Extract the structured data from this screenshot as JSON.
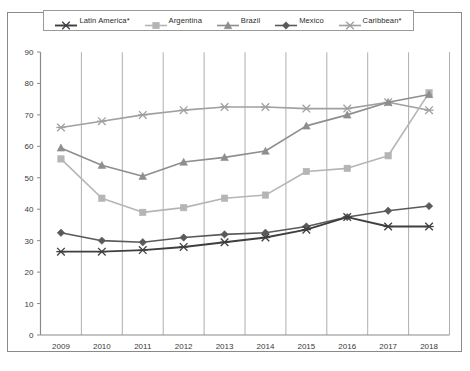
{
  "chart_data": {
    "type": "line",
    "title": "",
    "subtitle": "",
    "xlabel": "",
    "ylabel": "",
    "categories": [
      "2009",
      "2010",
      "2011",
      "2012",
      "2013",
      "2014",
      "2015",
      "2016",
      "2017",
      "2018"
    ],
    "xlim": [
      2009,
      2018
    ],
    "ylim": [
      0,
      90
    ],
    "ytick_values": [
      0,
      10,
      20,
      30,
      40,
      50,
      60,
      70,
      80,
      90
    ],
    "ytick_labels": [
      "0",
      "10",
      "20",
      "30",
      "40",
      "50",
      "60",
      "70",
      "80",
      "90"
    ],
    "xtick_labels": [
      "2009",
      "2010",
      "2011",
      "2012",
      "2013",
      "2014",
      "2015",
      "2016",
      "2017",
      "2018"
    ],
    "grid": "vertical",
    "legend_position": "top",
    "series": [
      {
        "name": "Latin America*",
        "marker": "cross",
        "color": "#3f3f3f",
        "values": [
          26.5,
          26.5,
          27.0,
          28.0,
          29.5,
          31.0,
          33.5,
          37.5,
          34.5,
          34.5
        ]
      },
      {
        "name": "Argentina",
        "marker": "square",
        "color": "#b5b5b5",
        "values": [
          56.0,
          43.5,
          39.0,
          40.5,
          43.5,
          44.5,
          52.0,
          53.0,
          57.0,
          77.0
        ]
      },
      {
        "name": "Brazil",
        "marker": "triangle",
        "color": "#8e8e8e",
        "values": [
          59.5,
          54.0,
          50.5,
          55.0,
          56.5,
          58.5,
          66.5,
          70.0,
          74.0,
          76.5
        ]
      },
      {
        "name": "Mexico",
        "marker": "diamond",
        "color": "#5a5a5a",
        "values": [
          32.5,
          30.0,
          29.5,
          31.0,
          32.0,
          32.5,
          34.5,
          37.5,
          39.5,
          41.0
        ]
      },
      {
        "name": "Caribbean*",
        "marker": "cross",
        "color": "#a0a0a0",
        "values": [
          66.0,
          68.0,
          70.0,
          71.5,
          72.5,
          72.5,
          72.0,
          72.0,
          74.0,
          71.5
        ]
      }
    ]
  },
  "legend": {
    "items": [
      {
        "label": "Latin America*"
      },
      {
        "label": "Argentina"
      },
      {
        "label": "Brazil"
      },
      {
        "label": "Mexico"
      },
      {
        "label": "Caribbean*"
      }
    ]
  },
  "caption": {
    "text": ""
  }
}
